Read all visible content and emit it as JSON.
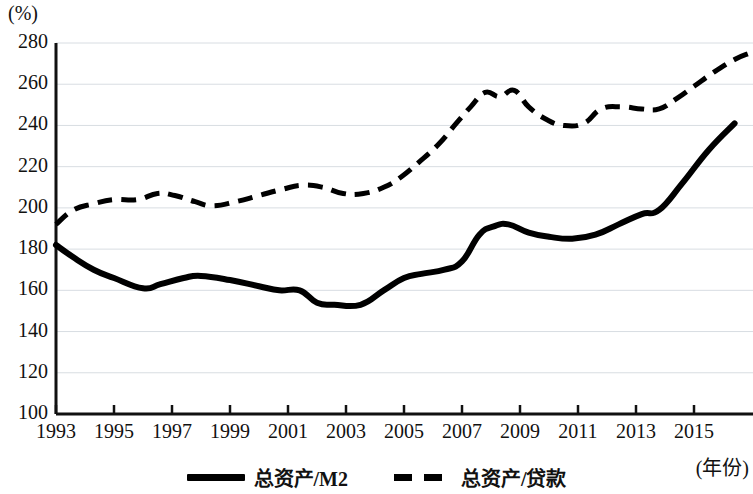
{
  "axes": {
    "y_unit_label": "(%)",
    "x_axis_title": "(年份)",
    "y_ticks": [
      "280",
      "260",
      "240",
      "220",
      "200",
      "180",
      "160",
      "140",
      "120",
      "100"
    ],
    "x_ticks": [
      "1993",
      "1995",
      "1997",
      "1999",
      "2001",
      "2003",
      "2005",
      "2007",
      "2009",
      "2011",
      "2013",
      "2015"
    ]
  },
  "legend": {
    "items": [
      {
        "label": "总资产/M2",
        "style": "solid",
        "color": "#000000"
      },
      {
        "label": "总资产/贷款",
        "style": "dashed",
        "color": "#000000"
      }
    ]
  },
  "chart_data": {
    "type": "line",
    "title": "",
    "xlabel": "(年份)",
    "ylabel": "(%)",
    "xlim": [
      1993,
      2016
    ],
    "ylim": [
      100,
      280
    ],
    "y_tick_step": 20,
    "grid": true,
    "grid_axis": "y",
    "legend_position": "bottom-center",
    "x": [
      1993,
      1994,
      1995,
      1996,
      1997,
      1998,
      1999,
      2000,
      2001,
      2002,
      2003,
      2004,
      2005,
      2006,
      2007,
      2008,
      2009,
      2010,
      2011,
      2012,
      2013,
      2014,
      2015,
      2016
    ],
    "series": [
      {
        "name": "总资产/M2",
        "style": "solid",
        "color": "#000000",
        "values": [
          182,
          173,
          166,
          161,
          164,
          167,
          165,
          162,
          160,
          154,
          153,
          153,
          165,
          168,
          173,
          189,
          192,
          187,
          185,
          185,
          189,
          195,
          199,
          210
        ]
      },
      {
        "name": "总资产/贷款",
        "style": "dashed",
        "color": "#000000",
        "values": [
          192,
          202,
          204,
          205,
          207,
          204,
          201,
          205,
          208,
          211,
          210,
          207,
          208,
          215,
          228,
          233,
          245,
          256,
          253,
          258,
          250,
          240,
          241,
          248
        ]
      }
    ],
    "series_extension_note": "x continues to 2016.5 for both series; tail values: 总资产/M2 ends at 240, 总资产/贷款 ends at 275"
  },
  "curve_points": {
    "solid": [
      [
        1993.0,
        182
      ],
      [
        1993.6,
        176
      ],
      [
        1994.3,
        170
      ],
      [
        1995.0,
        166
      ],
      [
        1996.0,
        161
      ],
      [
        1996.6,
        163
      ],
      [
        1997.4,
        166
      ],
      [
        1998.0,
        167
      ],
      [
        1999.0,
        165
      ],
      [
        2000.0,
        162
      ],
      [
        2000.7,
        160
      ],
      [
        2001.4,
        160
      ],
      [
        2002.0,
        154
      ],
      [
        2002.6,
        153
      ],
      [
        2003.5,
        153
      ],
      [
        2004.3,
        160
      ],
      [
        2005.0,
        166
      ],
      [
        2005.6,
        168
      ],
      [
        2006.4,
        170
      ],
      [
        2007.0,
        174
      ],
      [
        2007.6,
        187
      ],
      [
        2008.1,
        191
      ],
      [
        2008.6,
        192
      ],
      [
        2009.3,
        188
      ],
      [
        2010.0,
        186
      ],
      [
        2010.8,
        185
      ],
      [
        2011.6,
        187
      ],
      [
        2012.4,
        192
      ],
      [
        2013.2,
        197
      ],
      [
        2013.8,
        199
      ],
      [
        2014.6,
        212
      ],
      [
        2015.5,
        228
      ],
      [
        2016.4,
        241
      ]
    ],
    "dashed": [
      [
        1993.0,
        192
      ],
      [
        1993.6,
        199
      ],
      [
        1994.3,
        202
      ],
      [
        1995.0,
        204
      ],
      [
        1995.8,
        204
      ],
      [
        1996.5,
        207
      ],
      [
        1997.1,
        206
      ],
      [
        1997.8,
        203
      ],
      [
        1998.4,
        201
      ],
      [
        1999.2,
        203
      ],
      [
        2000.0,
        206
      ],
      [
        2000.8,
        209
      ],
      [
        2001.5,
        211
      ],
      [
        2002.2,
        210
      ],
      [
        2002.9,
        207
      ],
      [
        2003.6,
        207
      ],
      [
        2004.3,
        210
      ],
      [
        2004.9,
        215
      ],
      [
        2005.5,
        222
      ],
      [
        2006.2,
        231
      ],
      [
        2006.8,
        241
      ],
      [
        2007.3,
        249
      ],
      [
        2007.8,
        256
      ],
      [
        2008.3,
        254
      ],
      [
        2008.8,
        257
      ],
      [
        2009.3,
        249
      ],
      [
        2009.9,
        243
      ],
      [
        2010.5,
        240
      ],
      [
        2011.2,
        241
      ],
      [
        2011.8,
        248
      ],
      [
        2012.5,
        249
      ],
      [
        2013.2,
        248
      ],
      [
        2013.8,
        248
      ],
      [
        2014.4,
        253
      ],
      [
        2015.0,
        259
      ],
      [
        2015.7,
        266
      ],
      [
        2016.4,
        272
      ],
      [
        2016.9,
        275
      ]
    ]
  }
}
